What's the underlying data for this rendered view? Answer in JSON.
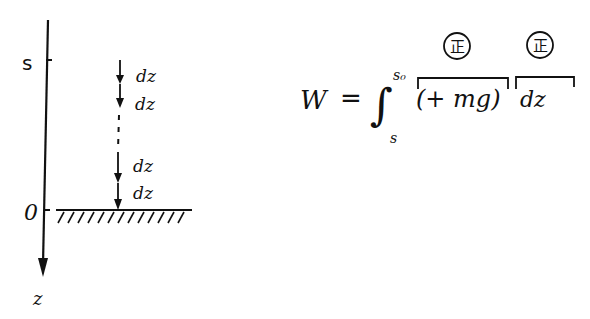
{
  "diagram": {
    "axis": {
      "label_top_tick": "s",
      "label_origin": "0",
      "label_axis": "z"
    },
    "increments": [
      {
        "label": "dz"
      },
      {
        "label": "dz"
      },
      {
        "label": "dz"
      },
      {
        "label": "dz"
      }
    ],
    "equation": {
      "lhs": "W",
      "equals": "=",
      "integral": "∫",
      "upper_limit": "s₀",
      "lower_limit": "s",
      "force_term": "(+ mg)",
      "differential": "dz",
      "force_sign_badge": "正",
      "differential_sign_badge": "正"
    }
  }
}
